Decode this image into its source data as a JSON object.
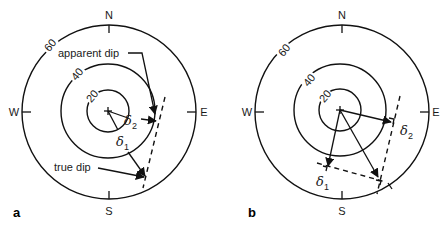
{
  "figure": {
    "panels": [
      {
        "id": "a",
        "label": "a",
        "compass": {
          "north": "N",
          "south": "S",
          "east": "E",
          "west": "W"
        },
        "ring_labels": [
          "20",
          "40",
          "60"
        ],
        "vectors": [
          {
            "name": "delta1",
            "symbol": "δ",
            "subscript": "1"
          },
          {
            "name": "delta2",
            "symbol": "δ",
            "subscript": "2"
          }
        ],
        "annotations": {
          "apparent_dip": "apparent dip",
          "true_dip": "true dip"
        }
      },
      {
        "id": "b",
        "label": "b",
        "compass": {
          "north": "N",
          "south": "S",
          "east": "E",
          "west": "W"
        },
        "ring_labels": [
          "20",
          "40",
          "60"
        ],
        "vectors": [
          {
            "name": "delta1",
            "symbol": "δ",
            "subscript": "1"
          },
          {
            "name": "delta2",
            "symbol": "δ",
            "subscript": "2"
          }
        ]
      }
    ],
    "colors": {
      "line": "#111111",
      "background": "#ffffff"
    }
  }
}
